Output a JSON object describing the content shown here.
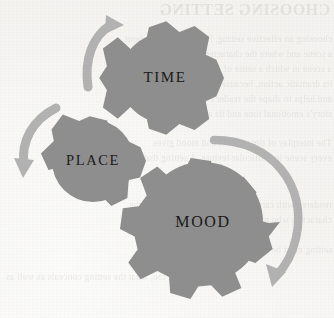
{
  "page": {
    "background_color": "#f6f5f3",
    "kind": "scanned-book-page-illustration"
  },
  "bleed_through": {
    "heading": "CHOOSING SETTING",
    "lines": [
      "choosing an effective setting, it helps to think about",
      "a scene and where the characters are located that",
      "a scene in which a sense of place can contribute to",
      "its dramatic action, because setting carries mood",
      "and helps to shape the reader's expectations of a",
      "story's emotional tone and its atmosphere.",
      "The interplay of time, place, and mood gives",
      "every scene its particular texture. A setting that is",
      "rendered with care can suggest the inner life of the",
      "characters who move through it. Most of all, the",
      "setting must be made vivid for the reader.",
      "Consider, too, what the setting conceals as well as"
    ]
  },
  "diagram": {
    "gear_color": "#8e8e8e",
    "gear_color_dark": "#848484",
    "arrow_color": "#b2b2b2",
    "label_color": "#181818",
    "gears": [
      {
        "id": "time",
        "label": "TIME",
        "cx": 165,
        "cy": 78,
        "outer_r": 59,
        "inner_r": 45,
        "teeth": 8,
        "rotation": 12
      },
      {
        "id": "place",
        "label": "PLACE",
        "cx": 93,
        "cy": 161,
        "outer_r": 53,
        "inner_r": 41,
        "teeth": 7,
        "rotation": 25
      },
      {
        "id": "mood",
        "label": "MOOD",
        "cx": 203,
        "cy": 222,
        "outer_r": 77,
        "inner_r": 60,
        "teeth": 12,
        "rotation": 8
      }
    ],
    "arrows": [
      {
        "id": "arrow-top-left",
        "direction": "clockwise-up-right"
      },
      {
        "id": "arrow-left",
        "direction": "counterclockwise-down-left"
      },
      {
        "id": "arrow-right-arc",
        "direction": "clockwise-down-left"
      }
    ]
  }
}
